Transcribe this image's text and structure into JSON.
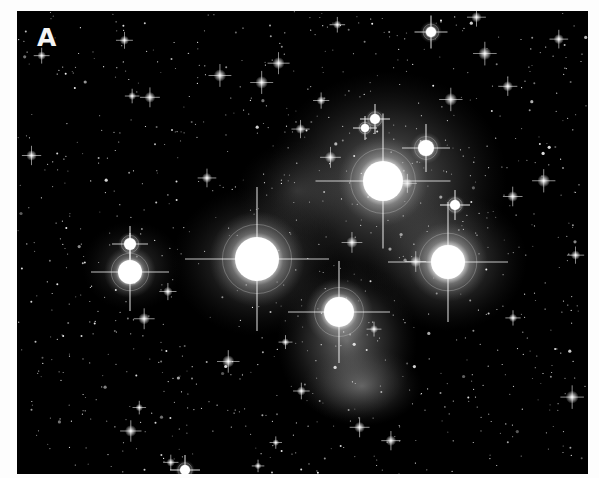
{
  "figure": {
    "panel_label": "A",
    "colors": {
      "background": "#000000",
      "border": "#fdfdfd",
      "stars": "#ffffff",
      "nebula": "#bfbfbf"
    }
  },
  "bright_stars": [
    {
      "name": "bright-star-center-left",
      "x": 240,
      "y": 248,
      "r": 22,
      "halo": 48
    },
    {
      "name": "bright-star-upper-center",
      "x": 366,
      "y": 170,
      "r": 20,
      "halo": 45
    },
    {
      "name": "bright-star-right",
      "x": 431,
      "y": 251,
      "r": 17,
      "halo": 40
    },
    {
      "name": "bright-star-lower-nebula",
      "x": 322,
      "y": 301,
      "r": 15,
      "halo": 34
    },
    {
      "name": "bright-star-left",
      "x": 113,
      "y": 261,
      "r": 12,
      "halo": 26
    },
    {
      "name": "star-left-above",
      "x": 113,
      "y": 233,
      "r": 6,
      "halo": 12
    },
    {
      "name": "star-ring-upper-right",
      "x": 409,
      "y": 137,
      "r": 8,
      "halo": 16
    },
    {
      "name": "star-upper-pair-a",
      "x": 358,
      "y": 108,
      "r": 5,
      "halo": 10
    },
    {
      "name": "star-upper-pair-b",
      "x": 348,
      "y": 117,
      "r": 4,
      "halo": 8
    },
    {
      "name": "star-right-mid",
      "x": 438,
      "y": 194,
      "r": 5,
      "halo": 10
    },
    {
      "name": "star-top",
      "x": 414,
      "y": 21,
      "r": 5,
      "halo": 11
    },
    {
      "name": "star-bottom",
      "x": 168,
      "y": 459,
      "r": 5,
      "halo": 10
    }
  ]
}
